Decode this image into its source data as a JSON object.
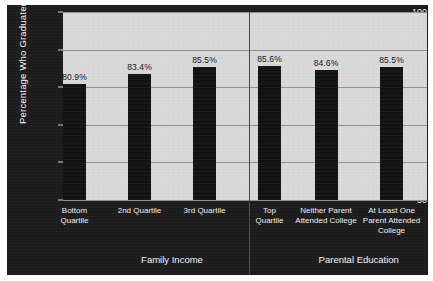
{
  "chart_data": {
    "type": "bar",
    "title": "",
    "xlabel": "",
    "ylabel": "Percentage Who Graduated",
    "ylim": [
      50,
      100
    ],
    "ytick_labels": [
      "100",
      "90",
      "80",
      "70",
      "60",
      "50"
    ],
    "ytick_values": [
      100,
      90,
      80,
      70,
      60,
      50
    ],
    "grid": true,
    "legend": "none",
    "categories": [
      "Bottom Quartile",
      "2nd Quartile",
      "3rd Quartile",
      "Top Quartile",
      "Neither Parent Attended College",
      "At Least One Parent Attended College"
    ],
    "values": [
      80.9,
      83.4,
      85.5,
      85.6,
      84.6,
      85.5
    ],
    "value_labels": [
      "80.9%",
      "83.4%",
      "85.5%",
      "85.6%",
      "84.6%",
      "85.5%"
    ],
    "groups": [
      {
        "label": "Family Income",
        "category_indices": [
          0,
          1,
          2,
          3
        ]
      },
      {
        "label": "Parental Education",
        "category_indices": [
          4,
          5
        ]
      }
    ],
    "bar_color": "#111111",
    "plot_background": "#d9d9d9",
    "frame_background": "#1c1c1c",
    "gridline_color": "#8f8f8f",
    "text_color_light": "#f2f2f2",
    "text_color_dark": "#141414"
  },
  "category_lines": [
    [
      "Bottom",
      "Quartile"
    ],
    [
      "2nd Quartile"
    ],
    [
      "3rd Quartile"
    ],
    [
      "Top",
      "Quartile"
    ],
    [
      "Neither Parent",
      "Attended College"
    ],
    [
      "At Least One",
      "Parent Attended",
      "College"
    ]
  ]
}
